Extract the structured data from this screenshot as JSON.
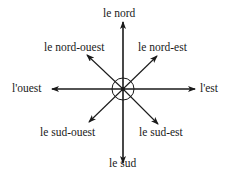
{
  "diagram": {
    "title": "",
    "center_label": "",
    "directions": {
      "n": "le nord",
      "ne": "le nord-est",
      "e": "l'est",
      "se": "le sud-est",
      "s": "le sud",
      "sw": "le sud-ouest",
      "w": "l'ouest",
      "nw": "le nord-ouest"
    },
    "line_color": "#1a1a1a",
    "background": "#ffffff"
  }
}
